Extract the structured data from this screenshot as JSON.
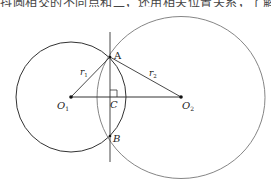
{
  "header": {
    "cropped_text": "抖圆相交的不同点和二，还用相关位置关系，了解"
  },
  "diagram": {
    "title": "",
    "points": {
      "A": {
        "label": "A",
        "x": 110,
        "y": 57
      },
      "B": {
        "label": "B",
        "x": 110,
        "y": 136
      },
      "C": {
        "label": "C",
        "x": 110,
        "y": 97
      },
      "O1": {
        "label": "O",
        "sub": "1",
        "x": 71,
        "y": 97
      },
      "O2": {
        "label": "O",
        "sub": "2",
        "x": 181,
        "y": 97
      }
    },
    "radii": {
      "r1": {
        "label": "r",
        "sub": "1"
      },
      "r2": {
        "label": "r",
        "sub": "2"
      }
    },
    "circles": [
      {
        "name": "circle-O1",
        "cx": 71,
        "cy": 97,
        "r": 55
      },
      {
        "name": "circle-O2",
        "cx": 181,
        "cy": 97,
        "rx": 84,
        "ry": 81
      }
    ],
    "colors": {
      "circle1": "#333333",
      "circle2": "#777777",
      "lines": "#333333"
    }
  }
}
